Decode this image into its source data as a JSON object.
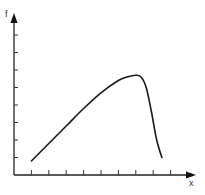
{
  "chart_data": {
    "type": "line",
    "title": "",
    "xlabel": "x",
    "ylabel": "f",
    "grid": false,
    "legend": null,
    "x_ticks": 9,
    "y_ticks": 8,
    "xlim": [
      0,
      10
    ],
    "ylim": [
      0,
      9
    ],
    "tick_labels": {
      "x": [],
      "y": []
    },
    "series": [
      {
        "name": "f(x)",
        "x": [
          1.0,
          2.0,
          3.0,
          4.0,
          5.0,
          6.0,
          6.5,
          7.0,
          7.3,
          7.6,
          7.9,
          8.2,
          8.5
        ],
        "values": [
          0.8,
          1.8,
          2.8,
          3.8,
          4.7,
          5.4,
          5.6,
          5.7,
          5.6,
          5.0,
          3.6,
          2.0,
          1.0
        ]
      }
    ]
  },
  "colors": {
    "stroke": "#1a1a1a",
    "background": "#ffffff"
  }
}
